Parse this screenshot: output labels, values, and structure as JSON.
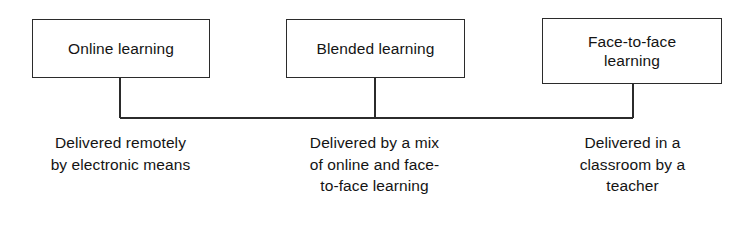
{
  "diagram": {
    "type": "comparison-bracket-diagram",
    "colors": {
      "background": "#ffffff",
      "stroke": "#2b2b2b",
      "text": "#141414"
    },
    "nodes": [
      {
        "id": "online",
        "label": "Online learning",
        "description": "Delivered remotely\nby electronic means"
      },
      {
        "id": "blended",
        "label": "Blended learning",
        "description": "Delivered by a mix\nof online and face-\nto-face learning"
      },
      {
        "id": "face-to-face",
        "label": "Face-to-face\nlearning",
        "description": "Delivered in a\nclassroom by a\nteacher"
      }
    ],
    "connector": {
      "style": "bracket",
      "horizontal_bar_y": 118,
      "bar_left_x": 120,
      "bar_right_x": 633,
      "stems": [
        120,
        375,
        633
      ]
    }
  }
}
